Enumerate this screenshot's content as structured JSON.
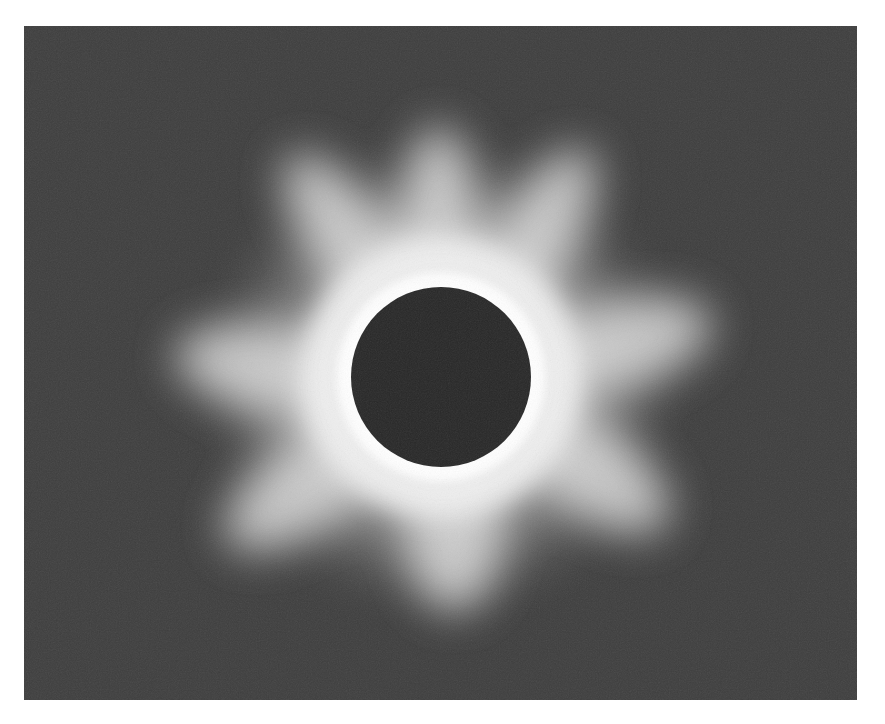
{
  "image": {
    "subject": "total solar eclipse",
    "description": "Black-and-white photograph of a total solar eclipse showing the dark lunar disk surrounded by a bright white corona with radial streamers",
    "colors": {
      "background": "#ffffff",
      "sky": "#3d3d3d",
      "corona": "#f2f2f2",
      "moon": "#262626"
    }
  }
}
